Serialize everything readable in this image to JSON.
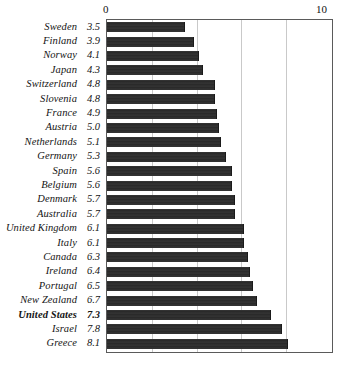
{
  "chart_data": {
    "type": "bar",
    "orientation": "horizontal",
    "title": "",
    "xlabel": "",
    "ylabel": "",
    "xlim": [
      0,
      10
    ],
    "xticks": [
      0,
      10
    ],
    "xtick_labels": [
      "0",
      "10"
    ],
    "grid": true,
    "gridline_values": [
      2,
      4,
      6,
      8
    ],
    "legend": "none",
    "categories": [
      "Sweden",
      "Finland",
      "Norway",
      "Japan",
      "Switzerland",
      "Slovenia",
      "France",
      "Austria",
      "Netherlands",
      "Germany",
      "Spain",
      "Belgium",
      "Denmark",
      "Australia",
      "United Kingdom",
      "Italy",
      "Canada",
      "Ireland",
      "Portugal",
      "New Zealand",
      "United States",
      "Israel",
      "Greece"
    ],
    "values": [
      3.5,
      3.9,
      4.1,
      4.3,
      4.8,
      4.8,
      4.9,
      5.0,
      5.1,
      5.3,
      5.6,
      5.6,
      5.7,
      5.7,
      6.1,
      6.1,
      6.3,
      6.4,
      6.5,
      6.7,
      7.3,
      7.8,
      8.1
    ],
    "value_labels": [
      "3.5",
      "3.9",
      "4.1",
      "4.3",
      "4.8",
      "4.8",
      "4.9",
      "5.0",
      "5.1",
      "5.3",
      "5.6",
      "5.6",
      "5.7",
      "5.7",
      "6.1",
      "6.1",
      "6.3",
      "6.4",
      "6.5",
      "6.7",
      "7.3",
      "7.8",
      "8.1"
    ],
    "highlighted_category": "United States",
    "bar_color": "#2b2b2b",
    "grid_color": "#c9c9c9",
    "frame_color": "#5a5a5a"
  }
}
